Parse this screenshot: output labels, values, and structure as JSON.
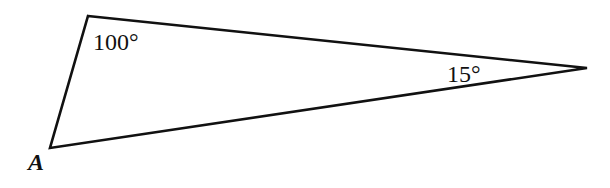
{
  "diagram": {
    "type": "triangle",
    "vertices": {
      "top": {
        "x": 88,
        "y": 16
      },
      "A": {
        "x": 50,
        "y": 148
      },
      "right": {
        "x": 587,
        "y": 68
      }
    },
    "labels": {
      "top_angle": "100°",
      "right_angle": "15°",
      "vertex_a": "A"
    },
    "stroke_color": "#111111"
  }
}
